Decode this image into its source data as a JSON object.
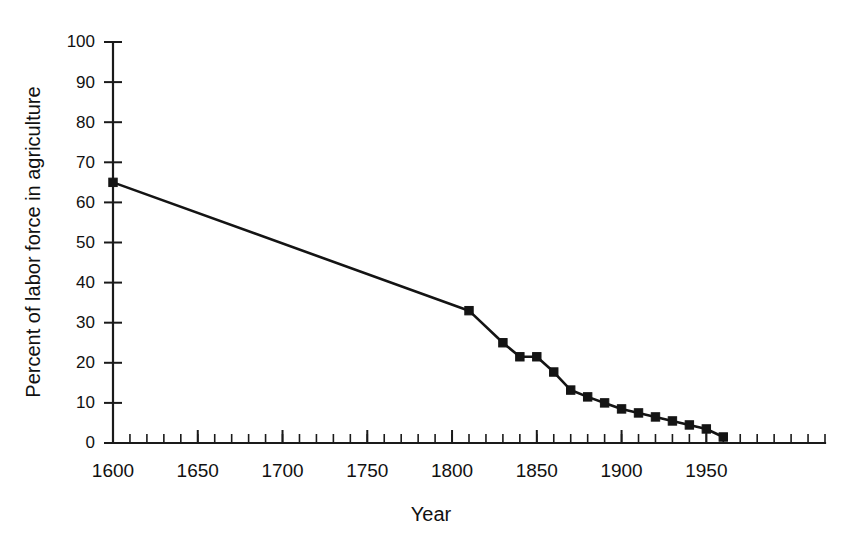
{
  "chart_data": {
    "type": "line",
    "title": "",
    "xlabel": "Year",
    "ylabel": "Percent of labor force in agriculture",
    "xlim": [
      1600,
      2020
    ],
    "ylim": [
      0,
      100
    ],
    "grid": false,
    "legend": "none",
    "x_tick_labels": [
      "1600",
      "1650",
      "1700",
      "1750",
      "1800",
      "1850",
      "1900",
      "1950"
    ],
    "x_tick_values": [
      1600,
      1650,
      1700,
      1750,
      1800,
      1850,
      1900,
      1950
    ],
    "x_minor_step": 10,
    "y_tick_labels": [
      "0",
      "10",
      "20",
      "30",
      "40",
      "50",
      "60",
      "70",
      "80",
      "90",
      "100"
    ],
    "y_tick_values": [
      0,
      10,
      20,
      30,
      40,
      50,
      60,
      70,
      80,
      90,
      100
    ],
    "series": [
      {
        "name": "Percent of labor force in agriculture",
        "marker": "filled-square",
        "x": [
          1600,
          1810,
          1830,
          1840,
          1850,
          1860,
          1870,
          1880,
          1890,
          1900,
          1910,
          1920,
          1930,
          1940,
          1950,
          1960
        ],
        "values": [
          65,
          33,
          25,
          21.5,
          21.5,
          17.7,
          13.2,
          11.5,
          10,
          8.5,
          7.5,
          6.5,
          5.5,
          4.5,
          3.5,
          1.5
        ]
      }
    ]
  }
}
